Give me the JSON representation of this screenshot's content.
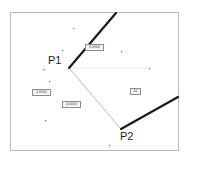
{
  "diagram": {
    "kind": "cad-geometry-sketch",
    "background_color": "#ffffff",
    "frame": {
      "color": "#b9b9b9",
      "x": 10,
      "y": 12,
      "width": 169,
      "height": 139
    },
    "points": [
      {
        "id": "P1",
        "label": "P1",
        "x": 69,
        "y": 68,
        "label_x": 48,
        "label_y": 55
      },
      {
        "id": "P2",
        "label": "P2",
        "x": 121,
        "y": 129,
        "label_x": 120,
        "label_y": 131
      }
    ],
    "thick_lines": [
      {
        "name": "construction-line-upper",
        "color": "#1a1a1a",
        "width": 2.2,
        "x1": 69,
        "y1": 68,
        "x2": 116,
        "y2": 13
      },
      {
        "name": "construction-line-lower",
        "color": "#1a1a1a",
        "width": 2.2,
        "x1": 121,
        "y1": 129,
        "x2": 178,
        "y2": 97
      }
    ],
    "thin_lines": [
      {
        "name": "segment-p1-p2",
        "color": "#9a9a9a",
        "width": 0.7,
        "x1": 69,
        "y1": 68,
        "x2": 121,
        "y2": 129
      },
      {
        "name": "horizontal-reference",
        "color": "#d4d4d4",
        "width": 0.5,
        "x1": 69,
        "y1": 68,
        "x2": 150,
        "y2": 68
      }
    ],
    "dimension_labels": [
      {
        "name": "dim-upper",
        "text": "3.0000",
        "x": 85,
        "y": 44,
        "width": 19,
        "height": 7
      },
      {
        "name": "dim-left",
        "text": "2.0000",
        "x": 32,
        "y": 89,
        "width": 19,
        "height": 7
      },
      {
        "name": "dim-lower",
        "text": "4.0000",
        "x": 62,
        "y": 101,
        "width": 19,
        "height": 7
      },
      {
        "name": "dim-angle",
        "text": "45",
        "x": 130,
        "y": 88,
        "width": 11,
        "height": 7
      }
    ],
    "snap_dots": [
      {
        "x": 62,
        "y": 50
      },
      {
        "x": 121,
        "y": 51
      },
      {
        "x": 43,
        "y": 69
      },
      {
        "x": 149,
        "y": 68
      },
      {
        "x": 49,
        "y": 81
      },
      {
        "x": 45,
        "y": 120
      },
      {
        "x": 109,
        "y": 145
      },
      {
        "x": 73,
        "y": 28
      }
    ],
    "dot_color": "#6b6b6b"
  }
}
